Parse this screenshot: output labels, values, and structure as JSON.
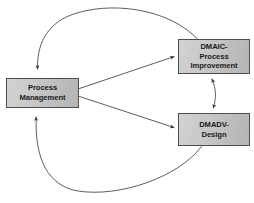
{
  "diagram": {
    "background_color": "#ffffff",
    "line_color": "#4d4d4d",
    "box_fill_light": "#d2d2d2",
    "box_fill_dark": "#b5b5b5",
    "box_border_color": "#4d4d4d",
    "text_color": "#1a1a1a",
    "nodes": [
      {
        "id": "process-management",
        "lines": [
          "Process",
          "Management"
        ]
      },
      {
        "id": "dmaic",
        "lines": [
          "DMAIC-",
          "Process",
          "Improvement"
        ]
      },
      {
        "id": "dmadv",
        "lines": [
          "DMADV-",
          "Design"
        ]
      }
    ],
    "connectors": [
      {
        "id": "pm-to-dmaic",
        "from": "process-management",
        "to": "dmaic",
        "style": "straight",
        "direction": "one-way"
      },
      {
        "id": "pm-to-dmadv",
        "from": "process-management",
        "to": "dmadv",
        "style": "straight",
        "direction": "one-way"
      },
      {
        "id": "dmaic-dmadv-link",
        "from": "dmaic",
        "to": "dmadv",
        "style": "curved",
        "direction": "two-way"
      },
      {
        "id": "dmaic-to-pm-arc",
        "from": "dmaic",
        "to": "process-management",
        "style": "arc-top",
        "direction": "one-way"
      },
      {
        "id": "dmadv-to-pm-arc",
        "from": "dmadv",
        "to": "process-management",
        "style": "arc-bottom",
        "direction": "one-way"
      }
    ]
  }
}
